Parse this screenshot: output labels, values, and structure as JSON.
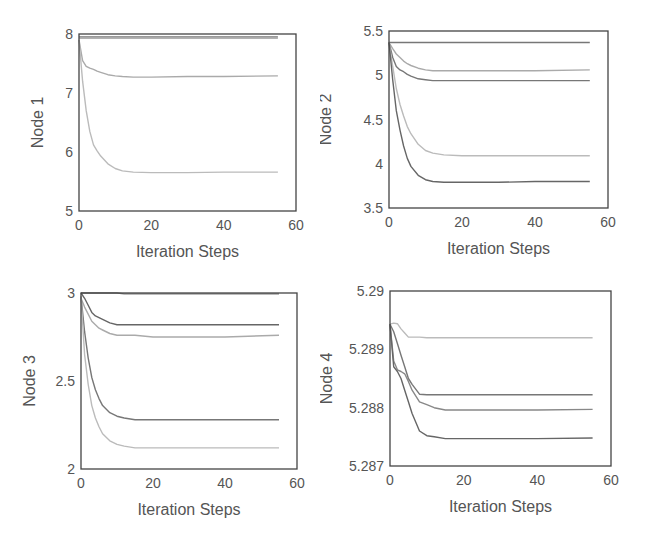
{
  "chart_data": [
    {
      "type": "line",
      "title": "",
      "xlabel": "Iteration Steps",
      "ylabel": "Node 1",
      "xlim": [
        0,
        60
      ],
      "ylim": [
        5,
        8
      ],
      "xticks": [
        "0",
        "20",
        "40",
        "60"
      ],
      "yticks": [
        "5",
        "6",
        "7",
        "8"
      ],
      "grid": false,
      "legend": null,
      "x": [
        0,
        1,
        2,
        3,
        4,
        5,
        6,
        8,
        10,
        12,
        15,
        20,
        30,
        40,
        55
      ],
      "series": [
        {
          "name": "line-a",
          "color": "#777777",
          "values": [
            7.95,
            7.95,
            7.95,
            7.95,
            7.95,
            7.95,
            7.95,
            7.95,
            7.95,
            7.95,
            7.95,
            7.95,
            7.95,
            7.95,
            7.95
          ]
        },
        {
          "name": "line-b",
          "color": "#999999",
          "values": [
            7.93,
            7.93,
            7.93,
            7.93,
            7.93,
            7.93,
            7.93,
            7.93,
            7.93,
            7.93,
            7.93,
            7.93,
            7.93,
            7.93,
            7.93
          ]
        },
        {
          "name": "line-c",
          "color": "#aaaaaa",
          "values": [
            7.9,
            7.55,
            7.45,
            7.42,
            7.4,
            7.37,
            7.35,
            7.31,
            7.29,
            7.28,
            7.27,
            7.27,
            7.28,
            7.28,
            7.29
          ]
        },
        {
          "name": "line-d",
          "color": "#bbbbbb",
          "values": [
            7.9,
            7.2,
            6.7,
            6.35,
            6.12,
            6.02,
            5.93,
            5.8,
            5.72,
            5.68,
            5.66,
            5.65,
            5.65,
            5.66,
            5.66
          ]
        }
      ]
    },
    {
      "type": "line",
      "title": "",
      "xlabel": "Iteration Steps",
      "ylabel": "Node 2",
      "xlim": [
        0,
        60
      ],
      "ylim": [
        3.5,
        5.5
      ],
      "xticks": [
        "0",
        "20",
        "40",
        "60"
      ],
      "yticks": [
        "3.5",
        "4",
        "4.5",
        "5",
        "5.5"
      ],
      "grid": false,
      "legend": null,
      "x": [
        0,
        1,
        2,
        3,
        4,
        5,
        6,
        8,
        10,
        12,
        15,
        20,
        30,
        40,
        55
      ],
      "series": [
        {
          "name": "line-a",
          "color": "#777777",
          "values": [
            5.37,
            5.37,
            5.37,
            5.37,
            5.37,
            5.37,
            5.37,
            5.37,
            5.37,
            5.37,
            5.37,
            5.37,
            5.37,
            5.37,
            5.37
          ]
        },
        {
          "name": "line-b",
          "color": "#aaaaaa",
          "values": [
            5.37,
            5.3,
            5.24,
            5.2,
            5.16,
            5.13,
            5.11,
            5.08,
            5.06,
            5.05,
            5.05,
            5.05,
            5.05,
            5.05,
            5.06
          ]
        },
        {
          "name": "line-c",
          "color": "#777777",
          "values": [
            5.37,
            5.2,
            5.1,
            5.06,
            5.04,
            5.01,
            4.99,
            4.96,
            4.95,
            4.94,
            4.94,
            4.94,
            4.94,
            4.94,
            4.94
          ]
        },
        {
          "name": "line-d",
          "color": "#bbbbbb",
          "values": [
            5.37,
            5.1,
            4.85,
            4.67,
            4.54,
            4.42,
            4.34,
            4.22,
            4.15,
            4.12,
            4.1,
            4.09,
            4.09,
            4.09,
            4.09
          ]
        },
        {
          "name": "line-e",
          "color": "#666666",
          "values": [
            5.37,
            4.95,
            4.6,
            4.38,
            4.2,
            4.06,
            3.97,
            3.87,
            3.82,
            3.8,
            3.79,
            3.79,
            3.79,
            3.8,
            3.8
          ]
        }
      ]
    },
    {
      "type": "line",
      "title": "",
      "xlabel": "Iteration Steps",
      "ylabel": "Node 3",
      "xlim": [
        0,
        60
      ],
      "ylim": [
        2,
        3
      ],
      "xticks": [
        "0",
        "20",
        "40",
        "60"
      ],
      "yticks": [
        "2",
        "2.5",
        "3"
      ],
      "grid": false,
      "legend": null,
      "x": [
        0,
        1,
        2,
        3,
        4,
        5,
        6,
        8,
        10,
        12,
        15,
        20,
        30,
        40,
        55
      ],
      "series": [
        {
          "name": "line-a",
          "color": "#777777",
          "values": [
            3.0,
            3.0,
            3.0,
            3.0,
            3.0,
            3.0,
            3.0,
            3.0,
            3.0,
            2.995,
            2.995,
            2.995,
            2.995,
            2.995,
            2.995
          ]
        },
        {
          "name": "line-b",
          "color": "#666666",
          "values": [
            3.0,
            2.97,
            2.93,
            2.89,
            2.87,
            2.86,
            2.85,
            2.83,
            2.82,
            2.82,
            2.82,
            2.82,
            2.82,
            2.82,
            2.82
          ]
        },
        {
          "name": "line-c",
          "color": "#aaaaaa",
          "values": [
            2.97,
            2.92,
            2.88,
            2.84,
            2.82,
            2.8,
            2.79,
            2.77,
            2.76,
            2.76,
            2.76,
            2.75,
            2.75,
            2.75,
            2.76
          ]
        },
        {
          "name": "line-d",
          "color": "#777777",
          "values": [
            2.98,
            2.78,
            2.63,
            2.52,
            2.45,
            2.4,
            2.36,
            2.32,
            2.3,
            2.29,
            2.28,
            2.28,
            2.28,
            2.28,
            2.28
          ]
        },
        {
          "name": "line-e",
          "color": "#bbbbbb",
          "values": [
            2.98,
            2.65,
            2.48,
            2.36,
            2.29,
            2.24,
            2.2,
            2.16,
            2.14,
            2.13,
            2.12,
            2.12,
            2.12,
            2.12,
            2.12
          ]
        }
      ]
    },
    {
      "type": "line",
      "title": "",
      "xlabel": "Iteration Steps",
      "ylabel": "Node 4",
      "xlim": [
        0,
        60
      ],
      "ylim": [
        5.287,
        5.29
      ],
      "xticks": [
        "0",
        "20",
        "40",
        "60"
      ],
      "yticks": [
        "5.287",
        "5.288",
        "5.289",
        "5.29"
      ],
      "grid": false,
      "legend": null,
      "x": [
        0,
        1,
        2,
        3,
        4,
        5,
        6,
        8,
        10,
        12,
        15,
        20,
        30,
        40,
        55
      ],
      "series": [
        {
          "name": "line-a",
          "color": "#bbbbbb",
          "values": [
            5.28943,
            5.28945,
            5.28944,
            5.28935,
            5.28928,
            5.28921,
            5.28921,
            5.28921,
            5.2892,
            5.2892,
            5.2892,
            5.2892,
            5.2892,
            5.2892,
            5.2892
          ]
        },
        {
          "name": "line-b",
          "color": "#777777",
          "values": [
            5.28943,
            5.2893,
            5.2891,
            5.2889,
            5.2887,
            5.2885,
            5.2884,
            5.28823,
            5.28822,
            5.28822,
            5.28822,
            5.28822,
            5.28822,
            5.28822,
            5.28822
          ]
        },
        {
          "name": "line-c",
          "color": "#888888",
          "values": [
            5.28943,
            5.2888,
            5.28865,
            5.28862,
            5.28858,
            5.28845,
            5.2883,
            5.2881,
            5.28805,
            5.288,
            5.28796,
            5.28796,
            5.28796,
            5.28796,
            5.28797
          ]
        },
        {
          "name": "line-d",
          "color": "#666666",
          "values": [
            5.28943,
            5.2887,
            5.28862,
            5.2885,
            5.2883,
            5.2881,
            5.2879,
            5.2876,
            5.28752,
            5.2875,
            5.28747,
            5.28747,
            5.28747,
            5.28747,
            5.28748
          ]
        }
      ]
    }
  ]
}
